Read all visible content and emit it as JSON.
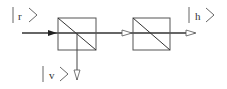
{
  "diagram": {
    "title": "",
    "labels": {
      "input_state": "r",
      "transmitted_state": "h",
      "reflected_state": "v"
    },
    "components": [
      {
        "name": "polarizing-beam-splitter-1",
        "type": "beam-splitter-cube"
      },
      {
        "name": "polarizing-beam-splitter-2",
        "type": "beam-splitter-cube"
      }
    ],
    "colors": {
      "line": "#444444",
      "beam": "#333333",
      "background": "#ffffff"
    }
  }
}
